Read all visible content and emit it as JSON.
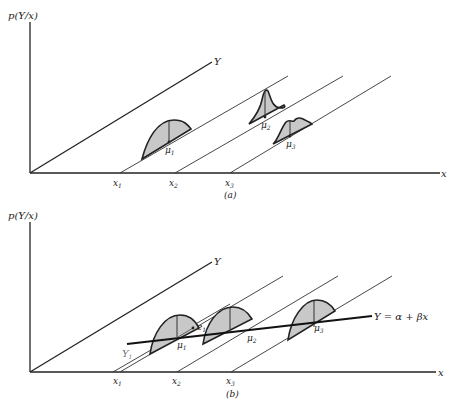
{
  "panels": [
    {
      "id": "a",
      "caption": "(a)",
      "y_axis_label": "p(Y/x)",
      "x_axis_label": "x",
      "depth_axis_label": "Y",
      "x_ticks": [
        "x",
        "x",
        "x"
      ],
      "x_tick_subs": [
        "1",
        "2",
        "3"
      ],
      "means": [
        "μ",
        "μ",
        "μ"
      ],
      "mean_subs": [
        "1",
        "2",
        "3"
      ],
      "description": "Conditional distributions of Y at x1, x2, x3 with differing shapes and means"
    },
    {
      "id": "b",
      "caption": "(b)",
      "y_axis_label": "p(Y/x)",
      "x_axis_label": "x",
      "depth_axis_label": "Y",
      "x_ticks": [
        "x",
        "x",
        "x"
      ],
      "x_tick_subs": [
        "1",
        "2",
        "3"
      ],
      "means": [
        "μ",
        "μ",
        "μ"
      ],
      "mean_subs": [
        "1",
        "2",
        "3"
      ],
      "observation_label": "Y",
      "observation_sub": "1",
      "error_label": "e",
      "error_sub": "1",
      "regression_label": "Y = α + βx",
      "description": "Identical conditional distributions with means on the regression line Y = α + βx"
    }
  ]
}
